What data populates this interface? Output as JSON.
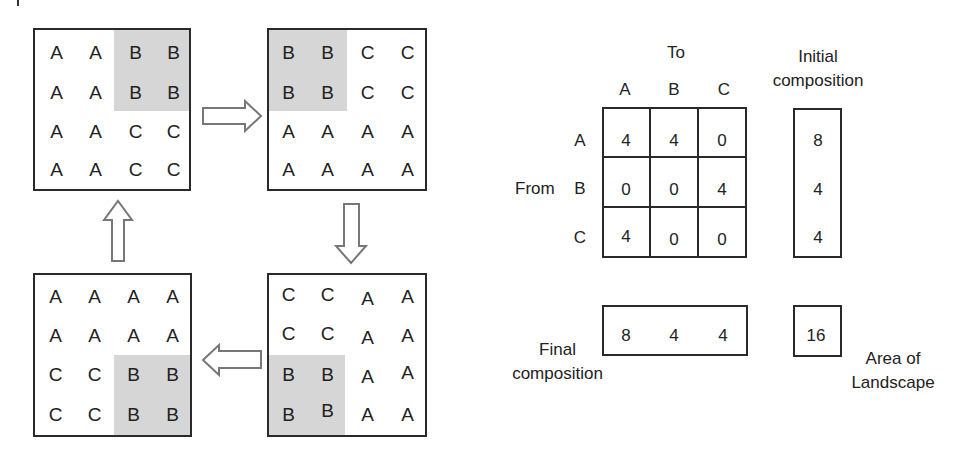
{
  "landscape_grids": [
    {
      "id": "top-left",
      "rows": [
        [
          "A",
          "A",
          "B",
          "B"
        ],
        [
          "A",
          "A",
          "B",
          "B"
        ],
        [
          "A",
          "A",
          "C",
          "C"
        ],
        [
          "A",
          "A",
          "C",
          "C"
        ]
      ],
      "shaded_region": "top-right 2x2"
    },
    {
      "id": "top-right",
      "rows": [
        [
          "B",
          "B",
          "C",
          "C"
        ],
        [
          "B",
          "B",
          "C",
          "C"
        ],
        [
          "A",
          "A",
          "A",
          "A"
        ],
        [
          "A",
          "A",
          "A",
          "A"
        ]
      ],
      "shaded_region": "top-left 2x2"
    },
    {
      "id": "bottom-right",
      "rows": [
        [
          "C",
          "C",
          "A",
          "A"
        ],
        [
          "C",
          "C",
          "A",
          "A"
        ],
        [
          "B",
          "B",
          "A",
          "A"
        ],
        [
          "B",
          "B",
          "A",
          "A"
        ]
      ],
      "shaded_region": "bottom-left 2x2"
    },
    {
      "id": "bottom-left",
      "rows": [
        [
          "A",
          "A",
          "A",
          "A"
        ],
        [
          "A",
          "A",
          "A",
          "A"
        ],
        [
          "C",
          "C",
          "B",
          "B"
        ],
        [
          "C",
          "C",
          "B",
          "B"
        ]
      ],
      "shaded_region": "bottom-right 2x2"
    }
  ],
  "arrows": [
    {
      "from": "top-left",
      "to": "top-right",
      "direction": "right"
    },
    {
      "from": "top-right",
      "to": "bottom-right",
      "direction": "down"
    },
    {
      "from": "bottom-right",
      "to": "bottom-left",
      "direction": "left"
    },
    {
      "from": "bottom-left",
      "to": "top-left",
      "direction": "up"
    }
  ],
  "transition_matrix": {
    "to_label": "To",
    "from_label": "From",
    "column_headers": [
      "A",
      "B",
      "C"
    ],
    "row_headers": [
      "A",
      "B",
      "C"
    ],
    "values": [
      [
        "4",
        "4",
        "0"
      ],
      [
        "0",
        "0",
        "4"
      ],
      [
        "4",
        "0",
        "0"
      ]
    ]
  },
  "initial_composition": {
    "label_line1": "Initial",
    "label_line2": "composition",
    "values": [
      "8",
      "4",
      "4"
    ]
  },
  "final_composition": {
    "label_line1": "Final",
    "label_line2": "composition",
    "values": [
      "8",
      "4",
      "4"
    ]
  },
  "landscape_area": {
    "label_line1": "Area of",
    "label_line2": "Landscape",
    "value": "16"
  },
  "colors": {
    "shade": "#d6d6d6",
    "border": "#2a2a2a",
    "arrow_stroke": "#777777"
  }
}
